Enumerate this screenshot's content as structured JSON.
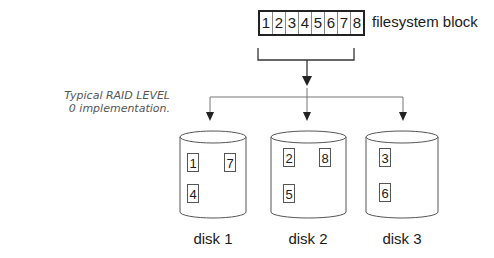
{
  "caption": {
    "line1": "Typical RAID LEVEL",
    "line2": "0 implementation."
  },
  "filesystem_block": {
    "label": "filesystem block",
    "cells": [
      "1",
      "2",
      "3",
      "4",
      "5",
      "6",
      "7",
      "8"
    ]
  },
  "disks": [
    {
      "label": "disk 1",
      "chunks": [
        "1",
        "7",
        "4"
      ]
    },
    {
      "label": "disk 2",
      "chunks": [
        "2",
        "8",
        "5"
      ]
    },
    {
      "label": "disk 3",
      "chunks": [
        "3",
        "6"
      ]
    }
  ],
  "colors": {
    "line": "#444444",
    "text": "#1a1a1a",
    "caption": "#555555"
  }
}
